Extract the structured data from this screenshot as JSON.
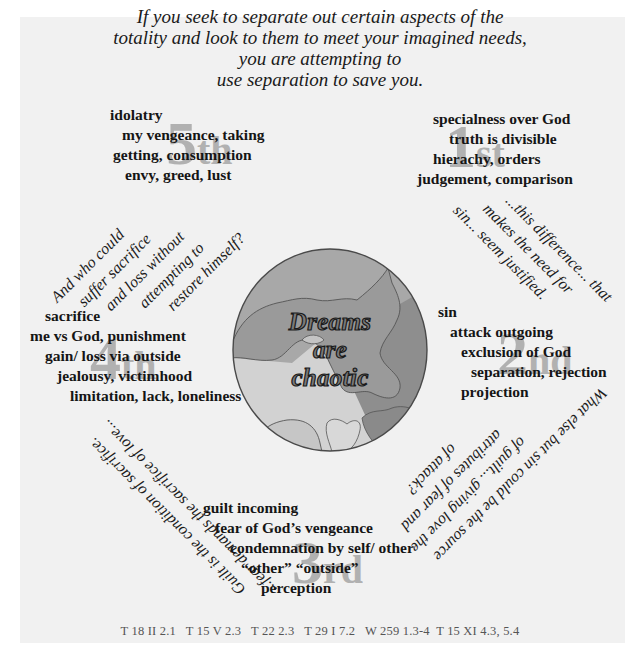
{
  "quote": {
    "lines": [
      "If you seek to separate out certain aspects of the",
      "totality and look to them to meet your imagined needs,",
      "you are attempting to",
      "use separation to save you."
    ]
  },
  "center": {
    "lines": [
      "Dreams",
      "are",
      "chaotic"
    ]
  },
  "stages": {
    "first": {
      "number": "1",
      "suffix": "st",
      "lines": [
        "specialness over God",
        "truth is divisible",
        "hierachy, orders",
        "judgement, comparison"
      ]
    },
    "second": {
      "number": "2",
      "suffix": "nd",
      "lines": [
        "sin",
        "attack outgoing",
        "exclusion of God",
        "separation, rejection",
        "projection"
      ]
    },
    "third": {
      "number": "3",
      "suffix": "rd",
      "lines": [
        "guilt incoming",
        "fear of God’s  vengeance",
        "condemnation by self/ other",
        "“other” “outside”",
        "perception"
      ]
    },
    "fourth": {
      "number": "4",
      "suffix": "th",
      "lines": [
        "sacrifice",
        "me vs God, punishment",
        "gain/ loss via outside",
        "jealousy, victimhood",
        "limitation, lack, loneliness"
      ]
    },
    "fifth": {
      "number": "5",
      "suffix": "th",
      "lines": [
        "idolatry",
        "my vengeance, taking",
        "getting, consumption",
        "envy, greed, lust"
      ]
    }
  },
  "connectors": {
    "top_left": [
      "And who could",
      "suffer sacrifice",
      "and loss without",
      "attempting to",
      "restore himself?"
    ],
    "top_right": [
      "...this difference... that",
      "makes the need for",
      "sin... seem justified."
    ],
    "bottom_left": [
      "Guilt is the condition of sacrifice.",
      "...fear demands the sacrifice of love..."
    ],
    "bottom_right": [
      "What else but sin could be the source",
      "of guilt... giving love the",
      "attributes of fear and",
      "of attack?"
    ]
  },
  "references": "T 18 II 2.1   T 15 V 2.3   T 22 2.3   T 29 I 7.2   W 259 1.3-4  T 15 XI 4.3, 5.4",
  "colors": {
    "panel": "#f1f1f1",
    "ordinal": "#a6a6a6",
    "globe_light": "#d0d0d0",
    "globe_mid": "#a9a9a9",
    "globe_dark": "#8a8a8a"
  }
}
